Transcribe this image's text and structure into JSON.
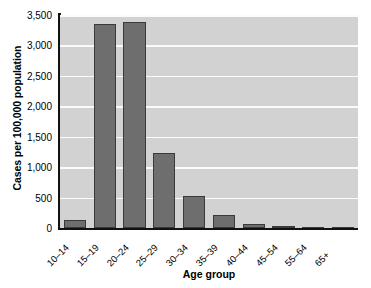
{
  "chart_data": {
    "type": "bar",
    "title": "",
    "xlabel": "Age group",
    "ylabel": "Cases per 100,000 population",
    "categories": [
      "10–14",
      "15–19",
      "20–24",
      "25–29",
      "30–34",
      "35–39",
      "40–44",
      "45–54",
      "55–64",
      "65+"
    ],
    "values": [
      125,
      3350,
      3390,
      1225,
      530,
      215,
      70,
      30,
      8,
      2
    ],
    "ylim": [
      0,
      3500
    ],
    "yticks": [
      0,
      500,
      1000,
      1500,
      2000,
      2500,
      3000,
      3500
    ],
    "ytick_labels": [
      "0",
      "500",
      "1,000",
      "1,500",
      "2,000",
      "2,500",
      "3,000",
      "3,500"
    ],
    "grid": true,
    "legend": false,
    "bar_color": "#6e6e6e",
    "bar_edge_color": "#3a3a3a",
    "plot_background": "#d2d2d2",
    "gridline_color": "#fbfbfb",
    "axis_color": "#111111"
  }
}
